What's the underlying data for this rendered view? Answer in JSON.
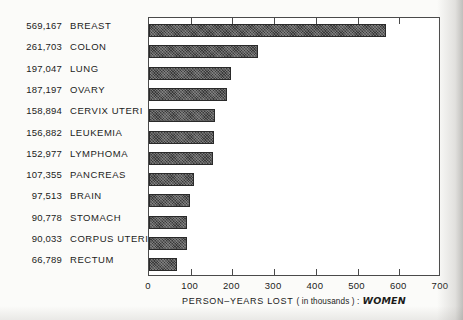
{
  "chart_data": {
    "type": "bar",
    "orientation": "horizontal",
    "title": "",
    "xlabel_prefix": "PERSON–YEARS LOST",
    "xlabel_unit": "( in thousands ) :",
    "xlabel_group": "WOMEN",
    "ylabel": "",
    "xlim": [
      0,
      700
    ],
    "grid": false,
    "legend": false,
    "tick_labels": [
      "0",
      "100",
      "200",
      "300",
      "400",
      "500",
      "600",
      "700"
    ],
    "tick_values": [
      0,
      100,
      200,
      300,
      400,
      500,
      600,
      700
    ],
    "categories": [
      "BREAST",
      "COLON",
      "LUNG",
      "OVARY",
      "CERVIX  UTERI",
      "LEUKEMIA",
      "LYMPHOMA",
      "PANCREAS",
      "BRAIN",
      "STOMACH",
      "CORPUS  UTERI",
      "RECTUM"
    ],
    "value_labels": [
      "569,167",
      "261,703",
      "197,047",
      "187,197",
      "158,894",
      "156,882",
      "152,977",
      "107,355",
      "97,513",
      "90,778",
      "90,033",
      "66,789"
    ],
    "values": [
      569.167,
      261.703,
      197.047,
      187.197,
      158.894,
      156.882,
      152.977,
      107.355,
      97.513,
      90.778,
      90.033,
      66.789
    ],
    "bar_color": "#3a3a3a",
    "frame_color": "#4a4a4a",
    "background": "#fbfbf9"
  }
}
